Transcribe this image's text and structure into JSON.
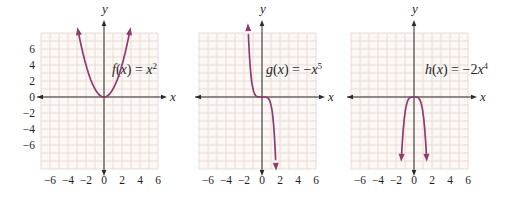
{
  "figure_title": "",
  "colors": {
    "curve": "#8d3c6b",
    "grid_line": "#e5d3ce",
    "grid_bg": "#fcf8f5",
    "axis": "#2a2a2a",
    "text": "#1f1f1f"
  },
  "chart_data": [
    {
      "type": "line",
      "panel": "left",
      "title": "f(x) = x²",
      "function": {
        "name": "f",
        "formula": "x^2",
        "coefficient": 1,
        "exponent": 2
      },
      "xlabel": "x",
      "ylabel": "y",
      "x_tick_labels": [
        "−6",
        "−4",
        "−2",
        "0",
        "2",
        "4",
        "6"
      ],
      "y_tick_labels": [
        "6",
        "4",
        "2",
        "0",
        "−2",
        "−4",
        "−6"
      ],
      "x_range": [
        -7,
        6.5
      ],
      "y_range": [
        -9,
        8
      ],
      "grid": true,
      "legend": "none",
      "points": [
        {
          "x": -2,
          "y": 4
        },
        {
          "x": -1,
          "y": 1
        },
        {
          "x": 0,
          "y": 0
        },
        {
          "x": 1,
          "y": 1
        },
        {
          "x": 2,
          "y": 4
        }
      ]
    },
    {
      "type": "line",
      "panel": "middle",
      "title": "g(x) = −x⁵",
      "function": {
        "name": "g",
        "formula": "-x^5",
        "coefficient": -1,
        "exponent": 5
      },
      "xlabel": "x",
      "ylabel": "y",
      "x_tick_labels": [
        "−6",
        "−4",
        "−2",
        "0",
        "2",
        "4",
        "6"
      ],
      "y_tick_labels": [],
      "x_range": [
        -7,
        6.5
      ],
      "y_range": [
        -9,
        8
      ],
      "grid": true,
      "legend": "none",
      "points": [
        {
          "x": -1.5,
          "y": 7.59
        },
        {
          "x": -1,
          "y": 1
        },
        {
          "x": 0,
          "y": 0
        },
        {
          "x": 1,
          "y": -1
        },
        {
          "x": 1.5,
          "y": -7.59
        }
      ]
    },
    {
      "type": "line",
      "panel": "right",
      "title": "h(x) = −2x⁴",
      "function": {
        "name": "h",
        "formula": "-2x^4",
        "coefficient": -2,
        "exponent": 4
      },
      "xlabel": "x",
      "ylabel": "y",
      "x_tick_labels": [
        "−6",
        "−4",
        "−2",
        "0",
        "2",
        "4",
        "6"
      ],
      "y_tick_labels": [],
      "x_range": [
        -7,
        6.5
      ],
      "y_range": [
        -9,
        8
      ],
      "grid": true,
      "legend": "none",
      "points": [
        {
          "x": -1,
          "y": -2
        },
        {
          "x": -0.5,
          "y": -0.125
        },
        {
          "x": 0,
          "y": 0
        },
        {
          "x": 0.5,
          "y": -0.125
        },
        {
          "x": 1,
          "y": -2
        }
      ]
    }
  ]
}
